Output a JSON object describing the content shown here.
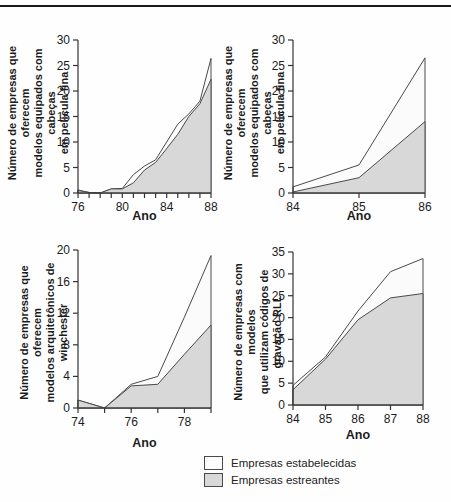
{
  "colors": {
    "line": "#4a4a4a",
    "axis": "#333333",
    "established_fill": "#fbfbfb",
    "entrant_fill": "#d8d8d8",
    "text": "#1c1c1c"
  },
  "legend": {
    "items": [
      {
        "label": "Empresas estabelecidas",
        "swatch": "established_fill"
      },
      {
        "label": "Empresas estreantes",
        "swatch": "entrant_fill"
      }
    ]
  },
  "chart_data": [
    {
      "type": "area",
      "ylabel": "Número de empresas que oferecem\nmodelos equipados com cabeças\nem película fina",
      "xlabel": "Ano",
      "x": [
        76,
        77,
        78,
        79,
        80,
        81,
        82,
        83,
        84,
        85,
        86,
        87,
        88
      ],
      "xlim": [
        76,
        88
      ],
      "ylim": [
        0,
        30
      ],
      "y_ticks": [
        0,
        5,
        10,
        15,
        20,
        25,
        30
      ],
      "x_ticks": [
        76,
        77,
        78,
        79,
        80,
        81,
        82,
        83,
        84,
        85,
        86,
        87,
        88
      ],
      "x_tick_labels": [
        "76",
        "",
        "",
        "",
        "80",
        "",
        "",
        "",
        "84",
        "",
        "",
        "",
        "88"
      ],
      "series": [
        {
          "name": "Empresas estabelecidas",
          "role": "total-outline",
          "values": [
            0.6,
            0.1,
            0,
            0.8,
            0.9,
            3.6,
            5.3,
            6.5,
            10,
            13.5,
            15.5,
            18,
            26.4
          ]
        },
        {
          "name": "Empresas estreantes",
          "role": "filled-area",
          "values": [
            0.5,
            0.1,
            0,
            0.8,
            0.8,
            2,
            4.5,
            6,
            8.7,
            11.5,
            15,
            17.5,
            22.3
          ]
        }
      ]
    },
    {
      "type": "area",
      "ylabel": "Número de empresas que oferecem\nmodelos equipados com cabeças\nem película fina",
      "xlabel": "Ano",
      "x": [
        84,
        85,
        86
      ],
      "xlim": [
        84,
        86
      ],
      "ylim": [
        0,
        30
      ],
      "y_ticks": [
        0,
        5,
        10,
        15,
        20,
        25,
        30
      ],
      "x_ticks": [
        84,
        85,
        86
      ],
      "x_tick_labels": [
        "84",
        "85",
        "86"
      ],
      "series": [
        {
          "name": "Empresas estabelecidas",
          "role": "total-outline",
          "values": [
            1.2,
            5.5,
            26.5
          ]
        },
        {
          "name": "Empresas estreantes",
          "role": "filled-area",
          "values": [
            0.2,
            3,
            14
          ]
        }
      ]
    },
    {
      "type": "area",
      "ylabel": "Número de empresas que oferecem\nmodelos arquitetônicos de winchester",
      "xlabel": "Ano",
      "x": [
        74,
        75,
        76,
        77,
        78,
        79
      ],
      "xlim": [
        74,
        79
      ],
      "ylim": [
        0,
        20
      ],
      "y_ticks": [
        0,
        4,
        8,
        12,
        16,
        20
      ],
      "x_ticks": [
        74,
        75,
        76,
        77,
        78,
        79
      ],
      "x_tick_labels": [
        "74",
        "",
        "76",
        "",
        "78",
        ""
      ],
      "series": [
        {
          "name": "Empresas estabelecidas",
          "role": "total-outline",
          "values": [
            1,
            0,
            3,
            4,
            11.5,
            19.3
          ]
        },
        {
          "name": "Empresas estreantes",
          "role": "filled-area",
          "values": [
            1,
            0,
            2.8,
            3,
            6.8,
            10.5
          ]
        }
      ]
    },
    {
      "type": "area",
      "ylabel": "Número de empresas com modelos\nque utilizam códigos de gravação RLL",
      "xlabel": "Ano",
      "x": [
        84,
        85,
        86,
        87,
        88
      ],
      "xlim": [
        84,
        88
      ],
      "ylim": [
        0,
        35
      ],
      "y_ticks": [
        0,
        5,
        10,
        15,
        20,
        25,
        30,
        35
      ],
      "x_ticks": [
        84,
        85,
        86,
        87,
        88
      ],
      "x_tick_labels": [
        "84",
        "85",
        "86",
        "87",
        "88"
      ],
      "series": [
        {
          "name": "Empresas estabelecidas",
          "role": "total-outline",
          "values": [
            4.5,
            11,
            21.5,
            30.5,
            33.5
          ]
        },
        {
          "name": "Empresas estreantes",
          "role": "filled-area",
          "values": [
            3.5,
            10.5,
            19.5,
            24.5,
            25.5
          ]
        }
      ]
    }
  ]
}
